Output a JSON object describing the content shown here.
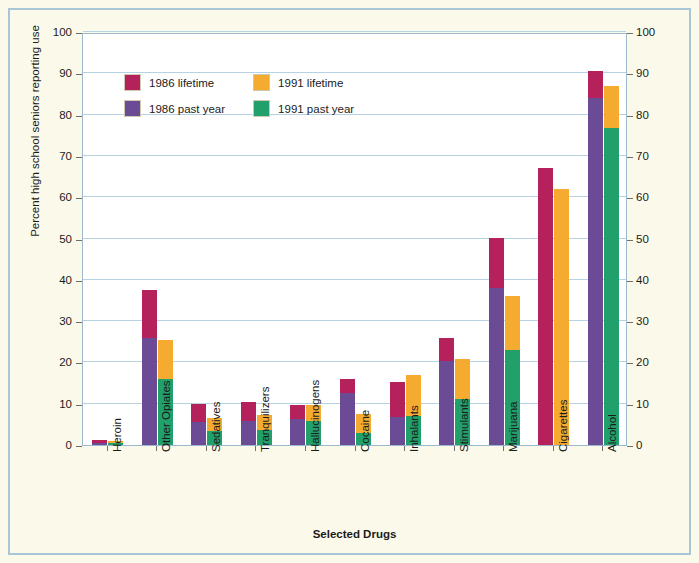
{
  "chart_data": {
    "type": "bar",
    "subtype": "grouped-stacked",
    "title": "",
    "xlabel": "Selected Drugs",
    "ylabel": "Percent high school seniors reporting use",
    "ylim": [
      0,
      100
    ],
    "ytick_step": 10,
    "ytick_labels": [
      "0",
      "10",
      "20",
      "30",
      "40",
      "50",
      "60",
      "70",
      "80",
      "90",
      "100"
    ],
    "grid": true,
    "dual_y_axis": true,
    "legend_position": "top-left-inside",
    "categories": [
      "Heroin",
      "Other Opiates",
      "Sedatives",
      "Tranquilizers",
      "Hallucinogens",
      "Cocaine",
      "Inhalants",
      "Stimulants",
      "Marijuana",
      "Cigarettes",
      "Alcohol"
    ],
    "series": [
      {
        "name": "1986 lifetime",
        "color": "#b5215a",
        "values": [
          1.1,
          37.5,
          10.0,
          10.4,
          9.7,
          16.0,
          15.2,
          25.8,
          50.2,
          67.0,
          90.5
        ]
      },
      {
        "name": "1986 past year",
        "color": "#6b4b96",
        "values": [
          0.6,
          26.0,
          5.5,
          5.8,
          6.4,
          12.5,
          6.9,
          20.3,
          38.0,
          0.0,
          84.0
        ]
      },
      {
        "name": "1991 lifetime",
        "color": "#f5ab30",
        "values": [
          0.9,
          25.5,
          6.5,
          7.2,
          9.6,
          7.5,
          17.0,
          20.8,
          36.0,
          62.0,
          87.0
        ]
      },
      {
        "name": "1991 past year",
        "color": "#22a06b",
        "values": [
          0.4,
          16.0,
          3.5,
          3.6,
          5.8,
          3.0,
          7.0,
          11.2,
          23.0,
          0.0,
          76.8
        ]
      }
    ]
  },
  "legend": {
    "items": [
      {
        "label": "1986 lifetime",
        "color": "#b5215a"
      },
      {
        "label": "1991 lifetime",
        "color": "#f5ab30"
      },
      {
        "label": "1986 past year",
        "color": "#6b4b96"
      },
      {
        "label": "1991 past year",
        "color": "#22a06b"
      }
    ]
  },
  "colors": {
    "background": "#fbfaea",
    "plot_background": "#ffffff",
    "border": "#a8c6d8",
    "gridline": "#b7d2e2"
  }
}
